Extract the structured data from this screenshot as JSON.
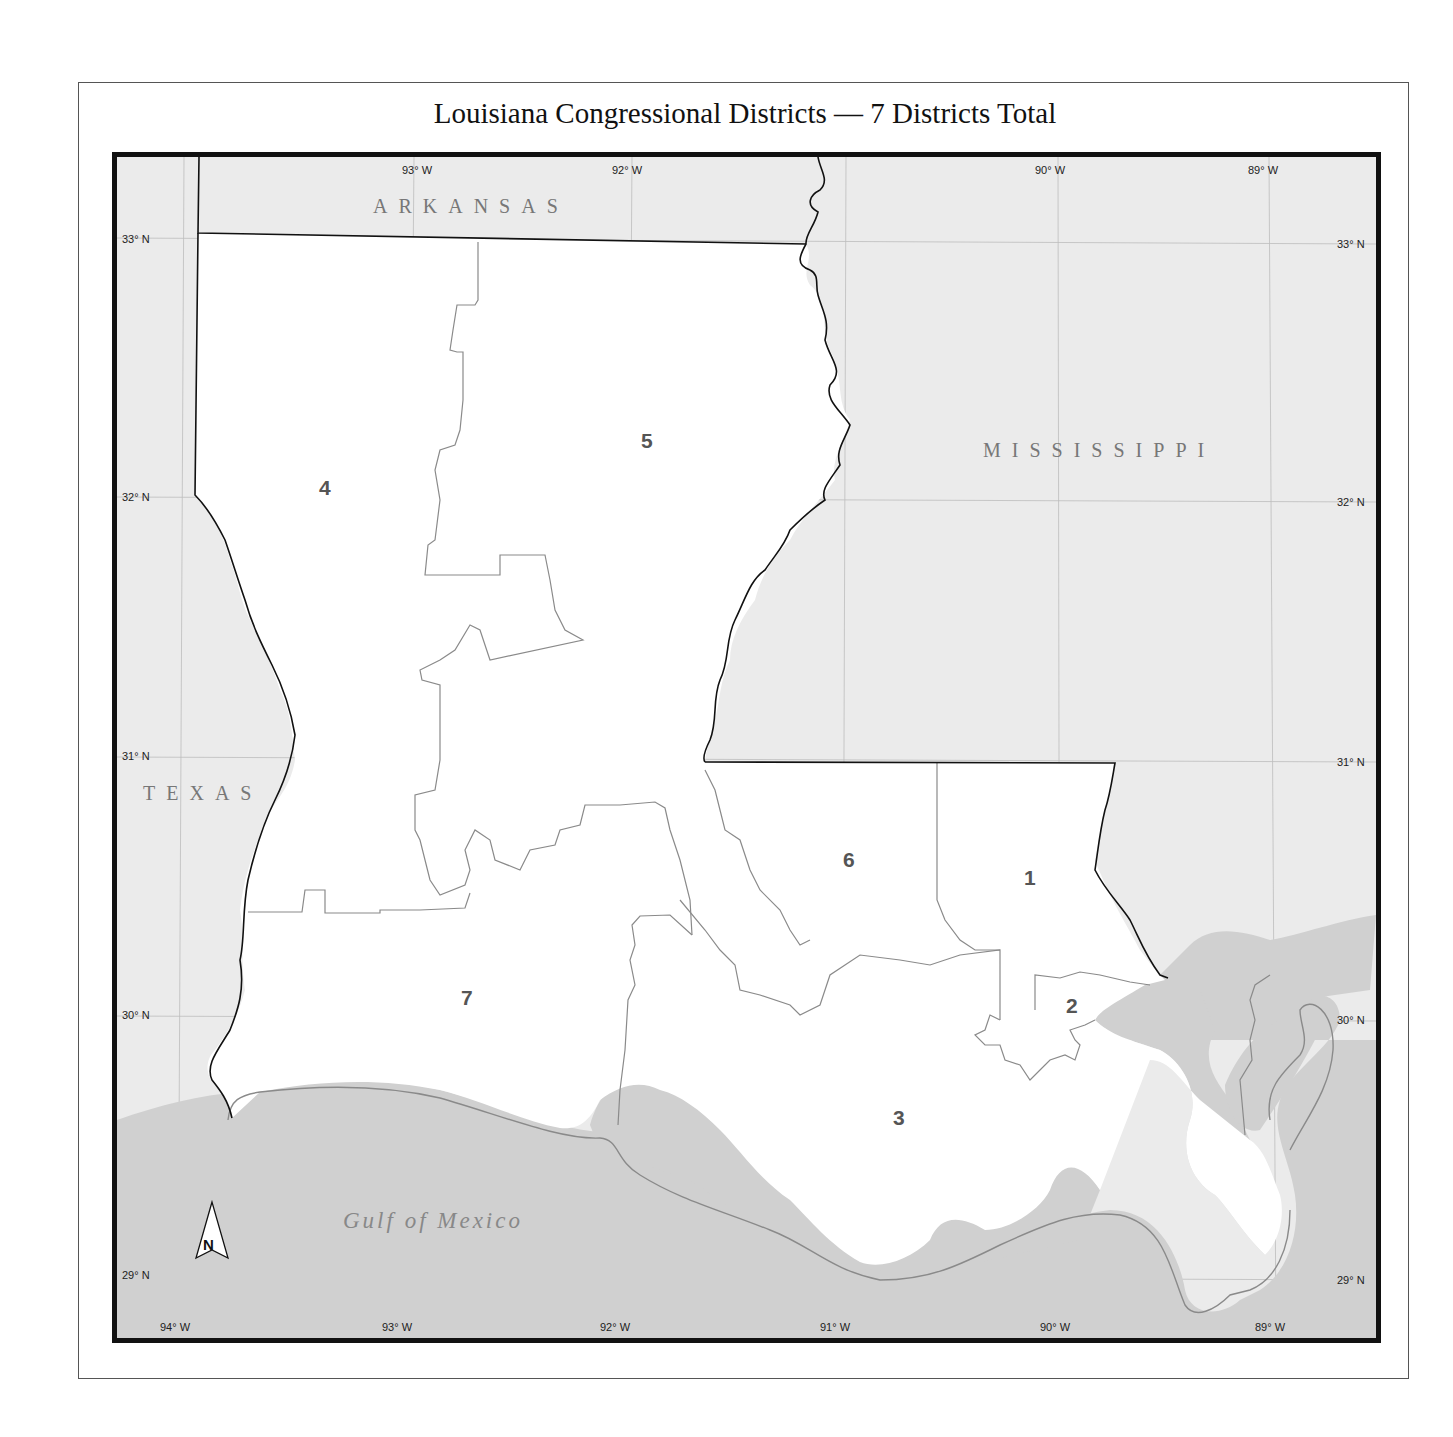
{
  "title": "Louisiana Congressional Districts — 7 Districts Total",
  "states": {
    "arkansas": "ARKANSAS",
    "mississippi": "MISSISSIPPI",
    "texas": "TEXAS",
    "gulf": "Gulf of Mexico"
  },
  "north_arrow": "N",
  "longitude_labels_top": [
    "93° W",
    "92° W",
    "90° W",
    "89° W"
  ],
  "longitude_labels_bottom": [
    "94° W",
    "93° W",
    "92° W",
    "91° W",
    "90° W",
    "89° W"
  ],
  "latitude_labels": [
    "33° N",
    "32° N",
    "31° N",
    "30° N",
    "29° N"
  ],
  "districts": [
    {
      "id": "1",
      "label": "1"
    },
    {
      "id": "2",
      "label": "2"
    },
    {
      "id": "3",
      "label": "3"
    },
    {
      "id": "4",
      "label": "4"
    },
    {
      "id": "5",
      "label": "5"
    },
    {
      "id": "6",
      "label": "6"
    },
    {
      "id": "7",
      "label": "7"
    }
  ],
  "colors": {
    "land_louisiana": "#ffffff",
    "neighbor_states": "#ebebeb",
    "water": "#cfcfcf",
    "state_border": "#111111",
    "district_border": "#888888"
  }
}
